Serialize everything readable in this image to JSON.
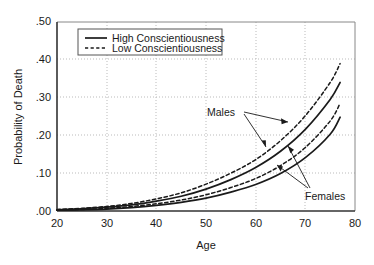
{
  "chart_data": {
    "type": "line",
    "title": "",
    "xlabel": "Age",
    "ylabel": "Probability of Death",
    "xlim": [
      20,
      80
    ],
    "ylim": [
      0.0,
      0.5
    ],
    "xticks": [
      20,
      30,
      40,
      50,
      60,
      70,
      80
    ],
    "xtick_labels": [
      "20",
      "30",
      "40",
      "50",
      "60",
      "70",
      "80"
    ],
    "yticks": [
      0.0,
      0.1,
      0.2,
      0.3,
      0.4,
      0.5
    ],
    "ytick_labels": [
      ".00",
      ".10",
      ".20",
      ".30",
      ".40",
      ".50"
    ],
    "grid": true,
    "grid_style": "dotted",
    "legend_position": "upper-left-inside",
    "legend_entries": [
      {
        "label": "High Conscientiousness",
        "style": "solid"
      },
      {
        "label": "Low Conscientiousness",
        "style": "dashed"
      }
    ],
    "annotations": [
      {
        "text": "Males",
        "x": 52,
        "y": 0.246
      },
      {
        "text": "Females",
        "x": 73.5,
        "y": 0.027
      }
    ],
    "x": [
      20,
      25,
      30,
      35,
      40,
      45,
      50,
      55,
      60,
      65,
      70,
      75,
      77
    ],
    "series": [
      {
        "name": "Males, Low Conscientiousness",
        "group": "Males",
        "style": "dashed",
        "color": "#1a1a1a",
        "values": [
          0.004,
          0.007,
          0.012,
          0.02,
          0.032,
          0.048,
          0.071,
          0.1,
          0.136,
          0.186,
          0.252,
          0.34,
          0.39
        ]
      },
      {
        "name": "Males, High Conscientiousness",
        "group": "Males",
        "style": "solid",
        "color": "#1a1a1a",
        "values": [
          0.003,
          0.006,
          0.01,
          0.016,
          0.026,
          0.039,
          0.058,
          0.083,
          0.115,
          0.158,
          0.216,
          0.295,
          0.34
        ]
      },
      {
        "name": "Females, Low Conscientiousness",
        "group": "Females",
        "style": "dashed",
        "color": "#1a1a1a",
        "values": [
          0.002,
          0.004,
          0.007,
          0.012,
          0.019,
          0.029,
          0.043,
          0.062,
          0.086,
          0.12,
          0.168,
          0.238,
          0.285
        ]
      },
      {
        "name": "Females, High Conscientiousness",
        "group": "Females",
        "style": "solid",
        "color": "#1a1a1a",
        "values": [
          0.002,
          0.003,
          0.005,
          0.009,
          0.015,
          0.023,
          0.034,
          0.05,
          0.07,
          0.099,
          0.141,
          0.203,
          0.248
        ]
      }
    ]
  },
  "axes": {
    "x_title": "Age",
    "y_title": "Probability of Death",
    "x_ticks": [
      "20",
      "30",
      "40",
      "50",
      "60",
      "70",
      "80"
    ],
    "y_ticks": [
      ".50",
      ".40",
      ".30",
      ".20",
      ".10",
      ".00"
    ]
  },
  "legend": {
    "high_label": "High Conscientiousness",
    "low_label": "Low Conscientiousness"
  },
  "annotations": {
    "males_label": "Males",
    "females_label": "Females"
  },
  "colors": {
    "line": "#1a1a1a",
    "grid": "#b4b4b4",
    "frame": "#555555",
    "background": "#ffffff"
  }
}
